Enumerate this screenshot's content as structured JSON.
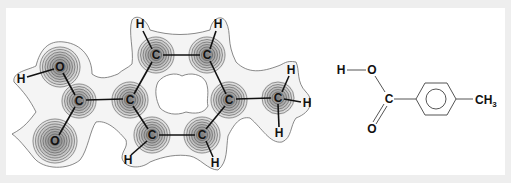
{
  "figure": {
    "colors": {
      "background": "#eeeeee",
      "panel": "#ffffff",
      "envelope_fill": "#f3f3f3",
      "contour": "#555555",
      "bond": "#111111",
      "skeletal_bond": "#555555"
    }
  },
  "density_map": {
    "atoms": [
      {
        "id": "H_oh",
        "label": "H",
        "x": 21,
        "y": 79
      },
      {
        "id": "O1",
        "label": "O",
        "x": 60,
        "y": 67
      },
      {
        "id": "C_carboxyl",
        "label": "C",
        "x": 79,
        "y": 101
      },
      {
        "id": "O2",
        "label": "O",
        "x": 55,
        "y": 141
      },
      {
        "id": "C1",
        "label": "C",
        "x": 130,
        "y": 100
      },
      {
        "id": "C2",
        "label": "C",
        "x": 156,
        "y": 55
      },
      {
        "id": "C3",
        "label": "C",
        "x": 207,
        "y": 55
      },
      {
        "id": "C4",
        "label": "C",
        "x": 229,
        "y": 100
      },
      {
        "id": "C5",
        "label": "C",
        "x": 202,
        "y": 135
      },
      {
        "id": "C6",
        "label": "C",
        "x": 152,
        "y": 135
      },
      {
        "id": "C_methyl",
        "label": "C",
        "x": 278,
        "y": 98
      },
      {
        "id": "H2",
        "label": "H",
        "x": 140,
        "y": 24
      },
      {
        "id": "H3",
        "label": "H",
        "x": 218,
        "y": 24
      },
      {
        "id": "H5",
        "label": "H",
        "x": 215,
        "y": 163
      },
      {
        "id": "H6",
        "label": "H",
        "x": 128,
        "y": 160
      },
      {
        "id": "Hm1",
        "label": "H",
        "x": 291,
        "y": 70
      },
      {
        "id": "Hm2",
        "label": "H",
        "x": 307,
        "y": 103
      },
      {
        "id": "Hm3",
        "label": "H",
        "x": 279,
        "y": 133
      }
    ],
    "heavy_atoms_with_contours": [
      "O1",
      "C_carboxyl",
      "O2",
      "C1",
      "C2",
      "C3",
      "C4",
      "C5",
      "C6",
      "C_methyl"
    ]
  },
  "skeletal_formula": {
    "labels": {
      "h": "H",
      "o_top": "O",
      "c": "C",
      "o_bottom": "O",
      "methyl_main": "CH",
      "methyl_sub": "3"
    }
  }
}
